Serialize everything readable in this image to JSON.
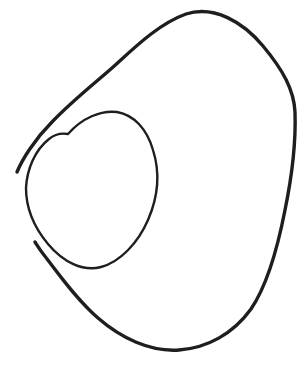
{
  "figure": {
    "kind": "hand-drawn-line-drawing",
    "title": "",
    "caption": "",
    "labels": [],
    "background_color": "#ffffff",
    "stroke_color": "#1f1d1e",
    "canvas": {
      "width": 304,
      "height": 380
    },
    "strokes": [
      {
        "name": "outer-blob-contour",
        "description": "large closed-looking outer outline, kidney/egg shaped, open at the left where both ends terminate as free tips",
        "stroke_width": 3.4,
        "path": "M 17 172 C 22 160 34 140 52 122 C 72 101 95 83 112 68 C 133 49 158 24 186 14 C 214 5 243 22 263 46 C 283 70 294 90 295 112 C 296 141 292 176 285 210 C 278 246 268 284 251 309 C 233 334 207 348 179 350 C 150 352 121 338 98 318 C 76 299 58 273 44 255 C 40 250 37 245 35 242"
      },
      {
        "name": "inner-oval-contour",
        "description": "smaller closed oval drawn inside the left portion of the outer contour",
        "stroke_width": 2.4,
        "path": "M 68 134 C 82 118 101 110 117 112 C 134 115 147 129 153 150 C 160 172 158 197 148 220 C 138 243 120 262 101 267 C 83 272 63 262 48 244 C 33 226 26 206 26 188 C 27 169 35 150 49 139 C 55 134 62 133 68 134 Z"
      }
    ]
  }
}
